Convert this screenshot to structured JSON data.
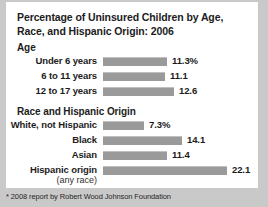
{
  "chart_data": {
    "type": "bar",
    "title": "Percentage of Uninsured Children by Age, Race, and Hispanic Origin: 2006",
    "orientation": "horizontal",
    "xlabel": "",
    "ylabel": "",
    "unit": "%",
    "grid": false,
    "legend": null,
    "axis_max": 26.5,
    "bar_color": "#9a9a9a",
    "groups": [
      {
        "heading": "Age",
        "categories": [
          "Under 6 years",
          "6 to 11 years",
          "12 to 17 years"
        ],
        "values": [
          11.3,
          11.1,
          12.6
        ],
        "value_labels": [
          "11.3%",
          "11.1",
          "12.6"
        ]
      },
      {
        "heading": "Race and Hispanic Origin",
        "categories": [
          "White, not Hispanic",
          "Black",
          "Asian",
          "Hispanic origin"
        ],
        "sublabels": [
          "",
          "",
          "",
          "(any race)"
        ],
        "values": [
          7.3,
          14.1,
          11.4,
          22.1
        ],
        "value_labels": [
          "7.3%",
          "14.1",
          "11.4",
          "22.1"
        ]
      }
    ]
  },
  "footnote": "* 2008 report by Robert Wood Johnson Foundation"
}
